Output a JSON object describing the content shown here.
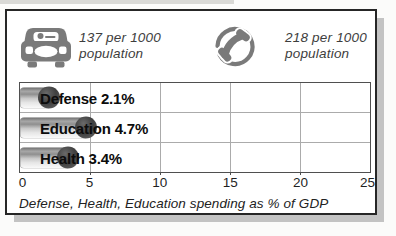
{
  "figure": {
    "stats": [
      {
        "icon": "car-icon",
        "value_line": "137 per 1000",
        "label_line": "population"
      },
      {
        "icon": "telephone-icon",
        "value_line": "218 per 1000",
        "label_line": "population"
      }
    ]
  },
  "chart_data": {
    "type": "bar",
    "orientation": "horizontal",
    "categories": [
      "Defense",
      "Education",
      "Health"
    ],
    "values": [
      2.1,
      4.7,
      3.4
    ],
    "bar_labels": [
      "Defense 2.1%",
      "Education 4.7%",
      "Health 3.4%"
    ],
    "xlim": [
      0,
      25
    ],
    "xticks": [
      "0",
      "5",
      "10",
      "15",
      "20",
      "25"
    ],
    "grid": "on",
    "legend": "none",
    "caption": "Defense, Health, Education spending as % of GDP",
    "unit": "% of GDP"
  },
  "colors": {
    "icon_gray": "#7a7a7a",
    "bar_cap": "#3f3f3f",
    "grid_line": "#ababab",
    "frame_border": "#262626",
    "drop_shadow": "#c3c3c3",
    "text": "#1c1c1c"
  }
}
